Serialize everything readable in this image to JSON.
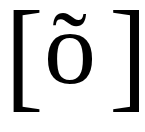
{
  "transcription": {
    "open_bracket": "[",
    "symbol": "õ",
    "close_bracket": "]"
  },
  "colors": {
    "text": "#000000",
    "background": "#ffffff"
  }
}
